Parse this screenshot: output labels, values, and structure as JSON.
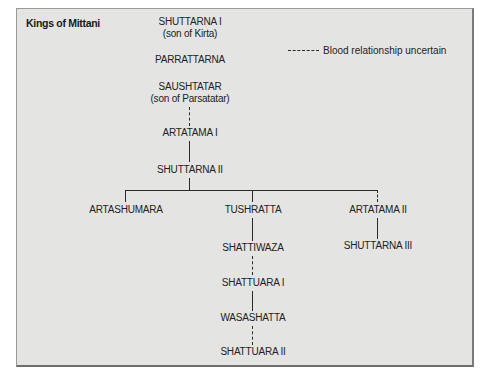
{
  "title": "Kings of Mittani",
  "legend": {
    "line_style": "dashed",
    "label": "Blood relationship uncertain"
  },
  "colors": {
    "background": "#e4e4e3",
    "line": "#2a2a2a",
    "text": "#222222"
  },
  "tree": {
    "trunk": [
      {
        "name": "SHUTTARNA I",
        "note": "(son of Kirta)"
      },
      {
        "name": "PARRATTARNA",
        "note": ""
      },
      {
        "name": "SAUSHTATAR",
        "note": "(son of Parsatatar)"
      },
      {
        "name": "ARTATAMA I",
        "note": "",
        "link_from_prev": "dashed"
      },
      {
        "name": "SHUTTARNA II",
        "note": "",
        "link_from_prev": "solid"
      }
    ],
    "children_of_shuttarna_ii": [
      {
        "name": "ARTASHUMARA",
        "link": "solid",
        "descendants": []
      },
      {
        "name": "TUSHRATTA",
        "link": "solid",
        "descendants": [
          {
            "name": "SHATTIWAZA",
            "link_from_prev": "solid"
          },
          {
            "name": "SHATTUARA I",
            "link_from_prev": "dashed"
          },
          {
            "name": "WASASHATTA",
            "link_from_prev": "solid"
          },
          {
            "name": "SHATTUARA II",
            "link_from_prev": "dashed"
          }
        ]
      },
      {
        "name": "ARTATAMA II",
        "link": "dashed",
        "descendants": [
          {
            "name": "SHUTTARNA III",
            "link_from_prev": "solid"
          }
        ]
      }
    ]
  }
}
